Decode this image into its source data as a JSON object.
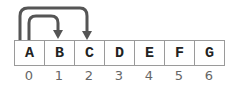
{
  "diagram": {
    "cells": [
      "A",
      "B",
      "C",
      "D",
      "E",
      "F",
      "G"
    ],
    "indices": [
      "0",
      "1",
      "2",
      "3",
      "4",
      "5",
      "6"
    ],
    "arrows": [
      {
        "from_index": 0,
        "to_index": 1,
        "label": "A to B"
      },
      {
        "from_index": 0,
        "to_index": 2,
        "label": "A to C"
      }
    ],
    "colors": {
      "arrow": "#555555",
      "border": "#9a9a9a",
      "text": "#222222",
      "index": "#666666"
    }
  }
}
